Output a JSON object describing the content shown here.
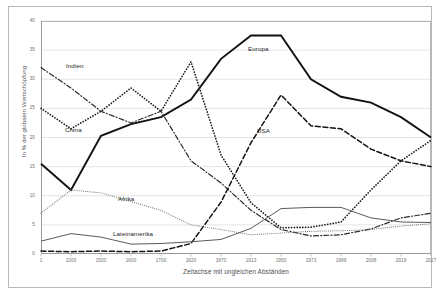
{
  "chart_data": {
    "type": "line",
    "title": "",
    "xlabel": "Zeitachse mit ungleichen Abständen",
    "ylabel": "In % der globalen Wertschöpfung",
    "x": [
      "1",
      "1000",
      "1500",
      "1600",
      "1700",
      "1820",
      "1870",
      "1913",
      "1950",
      "1973",
      "1989",
      "2008",
      "2019",
      "2027"
    ],
    "ylim": [
      0,
      40
    ],
    "yticks": [
      0,
      5,
      10,
      15,
      20,
      25,
      30,
      35,
      40
    ],
    "grid": true,
    "legend_position": "inline-labels",
    "series": [
      {
        "name": "Europa",
        "style": "solid-thick",
        "color": "#111111",
        "values": [
          15.5,
          11.0,
          20.3,
          22.3,
          23.5,
          26.5,
          33.5,
          37.5,
          37.5,
          30.0,
          27.0,
          26.0,
          23.5,
          20.0
        ]
      },
      {
        "name": "China",
        "style": "dotted",
        "color": "#1a1a1a",
        "values": [
          25.0,
          21.5,
          24.5,
          28.5,
          24.5,
          33.0,
          17.0,
          8.8,
          4.5,
          4.6,
          5.5,
          11.0,
          16.0,
          19.5
        ]
      },
      {
        "name": "Indien",
        "style": "dash-dot",
        "color": "#2a2a2a",
        "values": [
          32.0,
          28.5,
          24.5,
          22.5,
          24.5,
          16.0,
          12.2,
          7.5,
          4.2,
          3.1,
          3.3,
          4.3,
          6.2,
          7.0
        ]
      },
      {
        "name": "USA",
        "style": "dashed",
        "color": "#141414",
        "values": [
          0.5,
          0.4,
          0.5,
          0.4,
          0.5,
          1.8,
          8.9,
          19.1,
          27.3,
          22.0,
          21.5,
          18.0,
          16.0,
          15.0
        ]
      },
      {
        "name": "Afrika",
        "style": "fine-dotted",
        "color": "#777777",
        "values": [
          7.0,
          11.0,
          10.5,
          9.0,
          7.5,
          5.0,
          4.2,
          3.3,
          3.6,
          3.9,
          4.0,
          4.2,
          4.8,
          5.2
        ]
      },
      {
        "name": "Lateinamerika",
        "style": "solid-thin",
        "color": "#5a5a5a",
        "values": [
          2.2,
          3.5,
          2.9,
          1.7,
          1.8,
          2.1,
          2.5,
          4.4,
          7.8,
          8.0,
          8.0,
          6.2,
          5.5,
          5.4
        ]
      }
    ],
    "series_label_positions": [
      {
        "name": "Europa",
        "left": 248,
        "top": 45
      },
      {
        "name": "China",
        "left": 65,
        "top": 126
      },
      {
        "name": "Indien",
        "left": 66,
        "top": 62
      },
      {
        "name": "USA",
        "left": 257,
        "top": 127
      },
      {
        "name": "Afrika",
        "left": 118,
        "top": 195
      },
      {
        "name": "Lateinamerika",
        "left": 113,
        "top": 230
      }
    ]
  }
}
